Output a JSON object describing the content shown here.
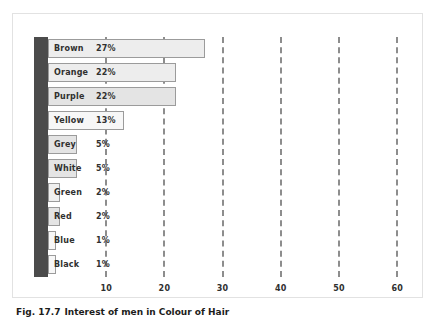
{
  "caption": {
    "number": "Fig. 17.7",
    "text": "Interest of men in Colour of Hair"
  },
  "chart_data": {
    "type": "bar",
    "orientation": "horizontal",
    "title": "",
    "xlabel": "",
    "ylabel": "",
    "xlim": [
      0,
      65
    ],
    "grid": true,
    "grid_axis": "x",
    "grid_style": "dashed",
    "legend": "none",
    "value_suffix": "%",
    "xticks": [
      10,
      20,
      30,
      40,
      50,
      60
    ],
    "xtick_labels": [
      "10",
      "20",
      "30",
      "40",
      "50",
      "60"
    ],
    "categories": [
      "Brown",
      "Orange",
      "Purple",
      "Yellow",
      "Grey",
      "White",
      "Green",
      "Red",
      "Blue",
      "Black"
    ],
    "values": [
      27,
      22,
      22,
      13,
      5,
      5,
      2,
      2,
      1,
      1
    ],
    "value_labels": [
      "27%",
      "22%",
      "22%",
      "13%",
      "5%",
      "5%",
      "2%",
      "2%",
      "1%",
      "1%"
    ],
    "bars": [
      {
        "label": "Brown",
        "value": 27,
        "value_label": "27%",
        "tone": "tone-a"
      },
      {
        "label": "Orange",
        "value": 22,
        "value_label": "22%",
        "tone": "tone-a"
      },
      {
        "label": "Purple",
        "value": 22,
        "value_label": "22%",
        "tone": "tone-b"
      },
      {
        "label": "Yellow",
        "value": 13,
        "value_label": "13%",
        "tone": "tone-c"
      },
      {
        "label": "Grey",
        "value": 5,
        "value_label": "5%",
        "tone": "tone-b"
      },
      {
        "label": "White",
        "value": 5,
        "value_label": "5%",
        "tone": "tone-b"
      },
      {
        "label": "Green",
        "value": 2,
        "value_label": "2%",
        "tone": "tone-d"
      },
      {
        "label": "Red",
        "value": 2,
        "value_label": "2%",
        "tone": "tone-b"
      },
      {
        "label": "Blue",
        "value": 1,
        "value_label": "1%",
        "tone": "tone-c"
      },
      {
        "label": "Black",
        "value": 1,
        "value_label": "1%",
        "tone": "tone-c"
      }
    ]
  },
  "style": {
    "spine_color": "#4b4b4b",
    "grid_color": "#8d8d8d",
    "bar_border_color": "#9b9b9b",
    "card_border_color": "#e2e2e2",
    "text_color": "#30302f",
    "background": "#ffffff"
  }
}
